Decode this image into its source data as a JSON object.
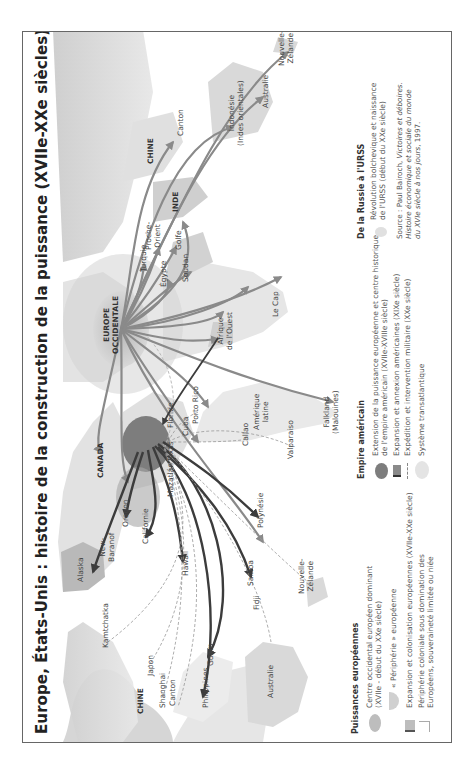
{
  "title": "Europe, États-Unis : histoire de la construction de la puissance (XVIIe-XXe siècles)",
  "map": {
    "regions": [
      {
        "id": "canada",
        "label": "CANADA",
        "bold": true
      },
      {
        "id": "chine_w",
        "label": "CHINE",
        "bold": true
      },
      {
        "id": "chine_e",
        "label": "CHINE",
        "bold": true
      },
      {
        "id": "inde",
        "label": "INDE",
        "bold": true
      },
      {
        "id": "europe",
        "label": "EUROPE\nOCCIDENTALE",
        "bold": true
      }
    ],
    "places": {
      "alaska": "Alaska",
      "new_baranof": "New-\nBaranof",
      "oregon": "Oregon",
      "californie": "Californie",
      "mazatlan": "Mazatlán",
      "hawaii": "Hawaii",
      "samoa": "Samoa",
      "fidji": "Fidji",
      "polynesie": "Polynésie",
      "nz_w": "Nouvelle-\nZélande",
      "kamtchatka": "Kamtchatka",
      "japon": "Japon",
      "shanghai": "Shanghai",
      "canton_w": "Canton",
      "philippines": "Philippines",
      "guam": "Guam",
      "australie_w": "Australie",
      "texas": "Texas",
      "floride": "Floride",
      "cuba": "Cuba",
      "porto_rico": "Porto Rico",
      "callao": "Callao",
      "amerique_latine": "Amérique\nlatine",
      "valparaiso": "Valparaiso",
      "falkland": "Falkland\n(Malouines)",
      "afrique_ouest": "Afrique\nde l'Ouest",
      "le_cap": "Le Cap",
      "soudan": "Soudan",
      "egypte": "Égypte",
      "turquie": "Turquie",
      "proche_orient": "Proche-\nOrient",
      "golfe": "Golfe",
      "canton_e": "Canton",
      "indonesie": "Indonésie\n(Indes orientales)",
      "australie_e": "Australie",
      "nz_e": "Nouvelle-\nZélande"
    }
  },
  "legend": {
    "european": {
      "title": "Puissances européennes",
      "items": [
        {
          "symbol": "grey-oval",
          "text": "Centre occidental européen dominant\n(XVIIe - début du XXe siècle)"
        },
        {
          "symbol": "periphery-crescent",
          "text": "« Périphérie » européenne"
        },
        {
          "symbol": "grey-arrow",
          "text": "Expansion et colonisation européennes (XVIIe-XXe siècle)"
        },
        {
          "symbol": "light-box",
          "text": "Périphérie coloniale sous domination des\nEuropéens, souveraineté limitée ou niée"
        }
      ]
    },
    "american": {
      "title": "Empire américain",
      "items": [
        {
          "symbol": "dark-oval",
          "text": "Extension de la puissance européenne et centre historique\nde l'empire américain (XVIIe-XVIIIe siècle)"
        },
        {
          "symbol": "dark-arrow",
          "text": "Expansion et annexion américaines (XIXe siècle)"
        },
        {
          "symbol": "dashed-line",
          "text": "Expédition et intervention militaire (XXe siècle)"
        },
        {
          "symbol": "light-oval",
          "text": "Système transatlantique"
        }
      ]
    },
    "russia": {
      "title": "De la Russie à l'URSS",
      "items": [
        {
          "symbol": "pale-blob",
          "text": "Révolution bolchevique et naissance\nde l'URSS (début du XXe siècle)"
        }
      ]
    },
    "source": {
      "prefix": "Source : Paul Bairoch, ",
      "italic1": "Victoires et déboires.",
      "italic2": "Histoire économique et sociale du monde",
      "italic3": "du XVIe siècle à nos jours",
      "suffix": ", 1997."
    }
  },
  "colors": {
    "land": "#e4e4e4",
    "land_dark": "#c9c9c9",
    "europe_core": "#bdbdbd",
    "us_core": "#7d7d7d",
    "arrow_grey": "#8a8a8a",
    "arrow_dark": "#3c3c3c",
    "periphery": "#d0d0d0"
  }
}
